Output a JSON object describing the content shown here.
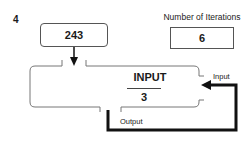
{
  "question_number": "4",
  "start_value": "243",
  "iterations": {
    "label": "Number of Iterations",
    "value": "6"
  },
  "machine": {
    "rule_top": "INPUT",
    "rule_bottom": "3",
    "input_label": "Input",
    "output_label": "Output"
  },
  "colors": {
    "outline": "#777777",
    "loop": "#111111",
    "text": "#1a1a1a"
  }
}
